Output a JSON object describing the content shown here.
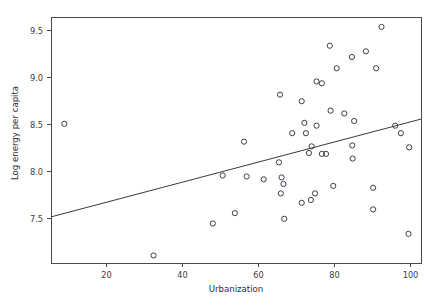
{
  "chart_data": {
    "type": "scatter",
    "title": "",
    "subtitle": "",
    "xlabel": "Urbanization",
    "ylabel": "Log energy per capita",
    "xlim": [
      5.5,
      102.9
    ],
    "ylim": [
      7.02,
      9.63
    ],
    "grid": false,
    "legend": null,
    "xticks": [
      20,
      40,
      60,
      80,
      100
    ],
    "xtick_labels": [
      "20",
      "40",
      "60",
      "80",
      "100"
    ],
    "yticks": [
      7.5,
      8.0,
      8.5,
      9.0,
      9.5
    ],
    "ytick_labels": [
      "7.5",
      "8.0",
      "8.5",
      "9.0",
      "9.5"
    ],
    "marker": {
      "shape": "open-circle",
      "radius": 2.6,
      "edge_color": "#3d3d4d",
      "fill": "none"
    },
    "points": [
      {
        "x": 9.0,
        "y": 8.5
      },
      {
        "x": 32.5,
        "y": 7.1
      },
      {
        "x": 48.1,
        "y": 7.44
      },
      {
        "x": 50.7,
        "y": 7.95
      },
      {
        "x": 53.9,
        "y": 7.55
      },
      {
        "x": 56.3,
        "y": 8.31
      },
      {
        "x": 57.0,
        "y": 7.94
      },
      {
        "x": 61.5,
        "y": 7.91
      },
      {
        "x": 65.5,
        "y": 8.09
      },
      {
        "x": 65.8,
        "y": 8.81
      },
      {
        "x": 66.0,
        "y": 7.76
      },
      {
        "x": 66.2,
        "y": 7.93
      },
      {
        "x": 66.7,
        "y": 7.86
      },
      {
        "x": 66.9,
        "y": 7.49
      },
      {
        "x": 69.0,
        "y": 8.4
      },
      {
        "x": 71.5,
        "y": 7.66
      },
      {
        "x": 71.5,
        "y": 8.74
      },
      {
        "x": 72.2,
        "y": 8.51
      },
      {
        "x": 72.6,
        "y": 8.4
      },
      {
        "x": 73.4,
        "y": 8.19
      },
      {
        "x": 73.9,
        "y": 7.69
      },
      {
        "x": 74.1,
        "y": 8.26
      },
      {
        "x": 75.0,
        "y": 7.76
      },
      {
        "x": 75.4,
        "y": 8.48
      },
      {
        "x": 75.4,
        "y": 8.95
      },
      {
        "x": 76.8,
        "y": 8.18
      },
      {
        "x": 76.8,
        "y": 8.93
      },
      {
        "x": 77.9,
        "y": 8.18
      },
      {
        "x": 78.9,
        "y": 9.33
      },
      {
        "x": 79.1,
        "y": 8.64
      },
      {
        "x": 79.8,
        "y": 7.84
      },
      {
        "x": 80.7,
        "y": 9.09
      },
      {
        "x": 82.7,
        "y": 8.61
      },
      {
        "x": 84.7,
        "y": 9.21
      },
      {
        "x": 84.8,
        "y": 8.27
      },
      {
        "x": 84.9,
        "y": 8.13
      },
      {
        "x": 85.3,
        "y": 8.53
      },
      {
        "x": 88.4,
        "y": 9.27
      },
      {
        "x": 90.3,
        "y": 7.82
      },
      {
        "x": 90.3,
        "y": 7.59
      },
      {
        "x": 91.1,
        "y": 9.09
      },
      {
        "x": 92.5,
        "y": 9.53
      },
      {
        "x": 96.1,
        "y": 8.48
      },
      {
        "x": 97.6,
        "y": 8.4
      },
      {
        "x": 99.6,
        "y": 7.33
      },
      {
        "x": 99.8,
        "y": 8.25
      }
    ],
    "fit_line": {
      "type": "linear-regression",
      "x_start": 5.5,
      "y_start": 7.51,
      "x_end": 102.9,
      "y_end": 8.55,
      "color": "#3a3a3a"
    }
  }
}
